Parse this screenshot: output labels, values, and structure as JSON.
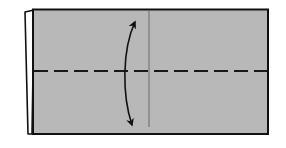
{
  "diagram": {
    "type": "origami-fold-step",
    "colors": {
      "paper": "#b8b8b8",
      "back_flap": "#ffffff",
      "outline": "#111111",
      "crease": "#6a6a6a",
      "fold_line": "#1a1a1a",
      "arrow": "#111111",
      "background": "#ffffff"
    },
    "elements": {
      "paper": {
        "x": 33,
        "y": 9,
        "width": 235,
        "height": 125
      },
      "back_flap": {
        "points": "25,12 33,10 31,134 27,134"
      },
      "vertical_crease": {
        "x": 149,
        "y1": 9,
        "y2": 128
      },
      "valley_fold_line": {
        "y": 71,
        "x1": 33,
        "x2": 268,
        "dash": "14 6"
      },
      "fold_arrow": {
        "style": "double-headed-curved",
        "from": [
          135,
          22
        ],
        "to": [
          132,
          125
        ]
      }
    }
  }
}
